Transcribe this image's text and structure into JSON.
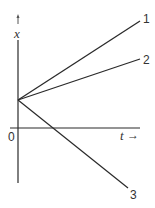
{
  "diagram": {
    "type": "position-time graph",
    "axes": {
      "y_label": "x",
      "x_label": "t",
      "origin_label": "0",
      "x_arrow": "→"
    },
    "lines": [
      {
        "id": "1",
        "label": "1",
        "description": "positive slope, steepest upward"
      },
      {
        "id": "2",
        "label": "2",
        "description": "positive slope, shallower upward"
      },
      {
        "id": "3",
        "label": "3",
        "description": "negative slope, crosses t-axis"
      }
    ],
    "colors": {
      "line": "#2a2a2a",
      "text": "#333333",
      "background": "#ffffff"
    }
  }
}
